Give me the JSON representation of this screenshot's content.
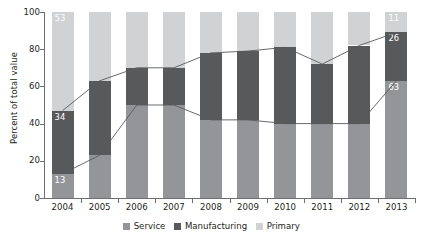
{
  "chart_data": {
    "type": "bar",
    "stacked": true,
    "stack_mode": "percent",
    "title": "",
    "subtitle": "",
    "xlabel": "",
    "ylabel": "Percent of total value",
    "ylim": [
      0,
      100
    ],
    "yticks": [
      0,
      20,
      40,
      60,
      80,
      100
    ],
    "grid": false,
    "legend_position": "bottom",
    "categories": [
      "2004",
      "2005",
      "2006",
      "2007",
      "2008",
      "2009",
      "2010",
      "2011",
      "2012",
      "2013"
    ],
    "series": [
      {
        "name": "Service",
        "color": "#939598",
        "values": [
          13,
          23,
          50,
          50,
          42,
          42,
          40,
          40,
          40,
          63
        ],
        "labels": [
          "13",
          "",
          "",
          "",
          "",
          "",
          "",
          "",
          "",
          "63"
        ]
      },
      {
        "name": "Manufacturing",
        "color": "#58595b",
        "values": [
          34,
          40,
          20,
          20,
          36,
          37,
          41,
          32,
          42,
          26
        ],
        "labels": [
          "34",
          "",
          "",
          "",
          "",
          "",
          "",
          "",
          "",
          "26"
        ]
      },
      {
        "name": "Primary",
        "color": "#d0d2d3",
        "values": [
          53,
          37,
          30,
          30,
          22,
          21,
          19,
          28,
          18,
          11
        ],
        "labels": [
          "53",
          "",
          "",
          "",
          "",
          "",
          "",
          "",
          "",
          "11"
        ]
      }
    ],
    "connector_lines": [
      {
        "name": "service-top-boundary",
        "values": [
          13,
          23,
          50,
          50,
          42,
          42,
          40,
          40,
          40,
          63
        ]
      },
      {
        "name": "manufacturing-top-boundary",
        "values": [
          47,
          63,
          70,
          70,
          78,
          79,
          81,
          72,
          82,
          89
        ]
      }
    ]
  },
  "legend": {
    "items": [
      {
        "label": "Service",
        "key": "service"
      },
      {
        "label": "Manufacturing",
        "key": "manufacturing"
      },
      {
        "label": "Primary",
        "key": "primary"
      }
    ]
  }
}
